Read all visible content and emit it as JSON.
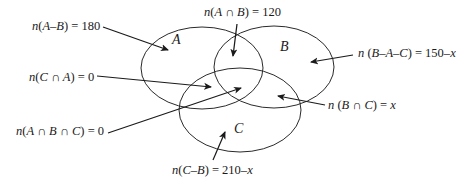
{
  "diagram": {
    "type": "venn",
    "sets": [
      {
        "name": "A",
        "cx": 202,
        "cy": 68,
        "rx": 61,
        "ry": 41
      },
      {
        "name": "B",
        "cx": 274,
        "cy": 67,
        "rx": 60,
        "ry": 41
      },
      {
        "name": "C",
        "cx": 240,
        "cy": 110,
        "rx": 61,
        "ry": 42
      }
    ],
    "stroke_color": "#2a2a2a",
    "labels": {
      "a_minus_b": {
        "prefix": "n(",
        "expr": "A–B",
        "suffix": ") = 180"
      },
      "a_and_b": {
        "prefix": "n(",
        "expr": "A ∩ B",
        "suffix": ") = 120"
      },
      "c_and_a": {
        "prefix": "n(",
        "expr": "C ∩ A",
        "suffix": ") = 0"
      },
      "a_and_b_and_c": {
        "prefix": "n(",
        "expr": "A ∩ B ∩ C",
        "suffix": ") = 0"
      },
      "b_minus_a_minus_c": {
        "prefix": "n (",
        "expr": "B–A–C",
        "suffix": ") = 150–",
        "var": "x"
      },
      "b_and_c": {
        "prefix": "n (",
        "expr": "B ∩ C",
        "suffix": ") = ",
        "var": "x"
      },
      "c_minus_b": {
        "prefix": "n(",
        "expr": "C–B",
        "suffix": ") = 210–",
        "var": "x"
      }
    },
    "set_names": {
      "a": "A",
      "b": "B",
      "c": "C"
    }
  }
}
